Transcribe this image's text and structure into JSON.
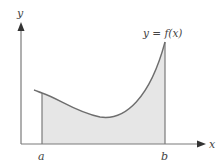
{
  "figure": {
    "curve_label": "y = f(x)",
    "x_axis_label": "x",
    "y_axis_label": "y",
    "lower_bound_label": "a",
    "upper_bound_label": "b"
  },
  "colors": {
    "axis": "#6e6e6e",
    "curve": "#6e6e6e",
    "fill": "#e6e6e6",
    "text": "#444444"
  }
}
